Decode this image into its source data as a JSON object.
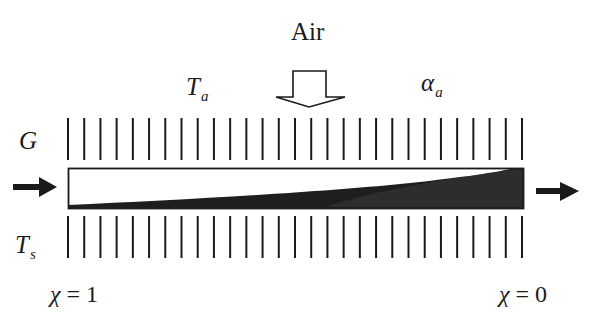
{
  "diagram": {
    "title": "Air",
    "labels": {
      "air_temp": {
        "symbol": "T",
        "subscript": "a"
      },
      "air_coeff": {
        "symbol": "α",
        "subscript": "a"
      },
      "mass_flow": {
        "symbol": "G"
      },
      "surface_temp": {
        "symbol": "T",
        "subscript": "s"
      },
      "inlet_quality": {
        "symbol": "χ",
        "eq": " = 1"
      },
      "outlet_quality": {
        "symbol": "χ",
        "eq": " = 0"
      }
    },
    "fins": {
      "count": 29,
      "x_start": 68,
      "x_end": 522
    },
    "tube": {
      "x": 68,
      "y": 168,
      "width": 456,
      "height": 41
    },
    "colors": {
      "ink": "#1a1a1a",
      "liquid": "#222222",
      "background": "#ffffff"
    }
  }
}
